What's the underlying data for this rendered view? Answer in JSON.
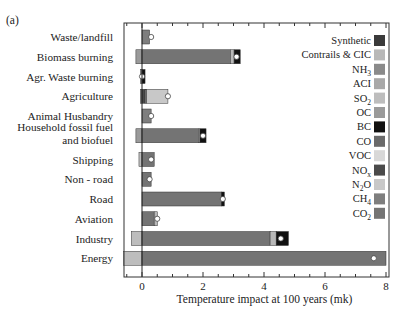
{
  "chart_data": {
    "type": "bar",
    "orientation": "horizontal",
    "stacked": true,
    "panel_label": "(a)",
    "title": "",
    "xlabel": "Temperature impact at 100 years (mk)",
    "ylabel": "",
    "xlim": [
      -0.6,
      8.1
    ],
    "xticks": [
      0,
      2,
      4,
      6,
      8
    ],
    "minor_tick_step": 0.5,
    "grid": false,
    "legend_position": "right",
    "categories": [
      "Waste/landfill",
      "Biomass burning",
      "Agr. Waste burning",
      "Agriculture",
      "Animal Husbandry",
      "Household fossil fuel and biofuel",
      "Shipping",
      "Non - road",
      "Road",
      "Aviation",
      "Industry",
      "Energy"
    ],
    "category_lines": [
      [
        "Waste/landfill"
      ],
      [
        "Biomass burning"
      ],
      [
        "Agr. Waste burning"
      ],
      [
        "Agriculture"
      ],
      [
        "Animal Husbandry"
      ],
      [
        "Household fossil fuel",
        "and biofuel"
      ],
      [
        "Shipping"
      ],
      [
        "Non - road"
      ],
      [
        "Road"
      ],
      [
        "Aviation"
      ],
      [
        "Industry"
      ],
      [
        "Energy"
      ]
    ],
    "legend": [
      {
        "name": "Synthetic",
        "sub": "",
        "color": "#3a3a3a"
      },
      {
        "name": "Contrails & CIC",
        "sub": "",
        "color": "#b8b8b8"
      },
      {
        "name": "NH",
        "sub": "3",
        "color": "#8a8a8a"
      },
      {
        "name": "ACI",
        "sub": "",
        "color": "#a8a8a8"
      },
      {
        "name": "SO",
        "sub": "2",
        "color": "#bdbdbd"
      },
      {
        "name": "OC",
        "sub": "",
        "color": "#9a9a9a"
      },
      {
        "name": "BC",
        "sub": "",
        "color": "#111111"
      },
      {
        "name": "CO",
        "sub": "",
        "color": "#6a6a6a"
      },
      {
        "name": "VOC",
        "sub": "",
        "color": "#d8d8d8"
      },
      {
        "name": "NO",
        "sub": "x",
        "color": "#4a4a4a"
      },
      {
        "name": "N",
        "sub": "2",
        "suffix": "O",
        "color": "#c8c8c8"
      },
      {
        "name": "CH",
        "sub": "4",
        "color": "#7e7e7e"
      },
      {
        "name": "CO",
        "sub": "2",
        "color": "#747474"
      }
    ],
    "series": [
      {
        "category": "Waste/landfill",
        "segments": [
          {
            "component": "CH4",
            "value": 0.25
          }
        ],
        "net": 0.3
      },
      {
        "category": "Biomass burning",
        "segments": [
          {
            "component": "OC",
            "value": -0.2
          },
          {
            "component": "CO2",
            "value": 2.9
          },
          {
            "component": "Contrails & CIC",
            "value": 0.12
          },
          {
            "component": "BC",
            "value": 0.2
          }
        ],
        "net": 3.1
      },
      {
        "category": "Agr. Waste burning",
        "segments": [
          {
            "component": "OC",
            "value": -0.05
          },
          {
            "component": "BC",
            "value": 0.1
          }
        ],
        "net": 0.0
      },
      {
        "category": "Agriculture",
        "segments": [
          {
            "component": "NH3",
            "value": -0.05
          },
          {
            "component": "NOx",
            "value": 0.1
          },
          {
            "component": "CH4",
            "value": 0.05
          },
          {
            "component": "N2O",
            "value": 0.7
          }
        ],
        "net": 0.85
      },
      {
        "category": "Animal Husbandry",
        "segments": [
          {
            "component": "CH4",
            "value": 0.3
          }
        ],
        "net": 0.3
      },
      {
        "category": "Household fossil fuel and biofuel",
        "segments": [
          {
            "component": "OC",
            "value": -0.2
          },
          {
            "component": "CO2",
            "value": 1.85
          },
          {
            "component": "SO2",
            "value": 0.05
          },
          {
            "component": "BC",
            "value": 0.2
          }
        ],
        "net": 2.0
      },
      {
        "category": "Shipping",
        "segments": [
          {
            "component": "SO2",
            "value": -0.1
          },
          {
            "component": "CO2",
            "value": 0.4
          }
        ],
        "net": 0.3
      },
      {
        "category": "Non - road",
        "segments": [
          {
            "component": "CO2",
            "value": 0.3
          }
        ],
        "net": 0.25
      },
      {
        "category": "Road",
        "segments": [
          {
            "component": "CO2",
            "value": 2.6
          },
          {
            "component": "BC",
            "value": 0.1
          }
        ],
        "net": 2.65
      },
      {
        "category": "Aviation",
        "segments": [
          {
            "component": "CO2",
            "value": 0.4
          },
          {
            "component": "Contrails & CIC",
            "value": 0.1
          }
        ],
        "net": 0.5
      },
      {
        "category": "Industry",
        "segments": [
          {
            "component": "SO2",
            "value": -0.35
          },
          {
            "component": "CO2",
            "value": 4.2
          },
          {
            "component": "Contrails & CIC",
            "value": 0.2
          },
          {
            "component": "BC",
            "value": 0.4
          }
        ],
        "net": 4.55
      },
      {
        "category": "Energy",
        "segments": [
          {
            "component": "SO2",
            "value": -0.6
          },
          {
            "component": "CO2",
            "value": 8.0
          }
        ],
        "net": 7.6
      }
    ]
  }
}
